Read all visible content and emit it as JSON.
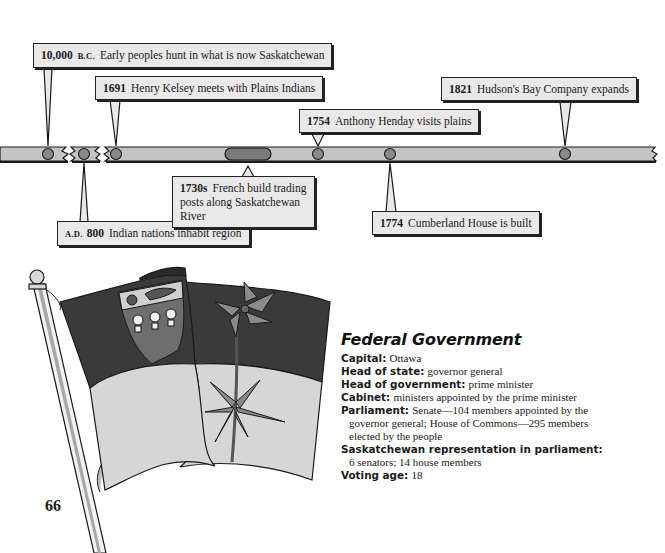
{
  "timeline": {
    "events": [
      {
        "year": "10,000",
        "era": "B.C.",
        "text": "Early peoples hunt in what is now Saskatchewan",
        "position": "above"
      },
      {
        "year": "1691",
        "era": "",
        "text": "Henry Kelsey meets with Plains Indians",
        "position": "above"
      },
      {
        "year": "1754",
        "era": "",
        "text": "Anthony Henday visits plains",
        "position": "above"
      },
      {
        "year": "1821",
        "era": "",
        "text": "Hudson's Bay Company expands",
        "position": "above"
      },
      {
        "year": "800",
        "era": "A.D.",
        "text": "Indian nations inhabit region",
        "position": "below"
      },
      {
        "year": "1730s",
        "era": "",
        "text": "French build trading posts along Saskatchewan River",
        "line1": "French build trading",
        "line2": "posts along Saskatchewan River",
        "position": "below"
      },
      {
        "year": "1774",
        "era": "",
        "text": "Cumberland House is built",
        "position": "below"
      }
    ],
    "colors": {
      "bar": "#c4c4c4",
      "marker": "#8a8a8a",
      "outline": "#1a1a1a",
      "callout_bg": "#e9e9e9"
    }
  },
  "flag": {
    "description": "Saskatchewan provincial flag on a pole",
    "colors": {
      "top_band": "#3a3a3a",
      "bottom_band": "#d6d6d6",
      "shield": "#6e6e6e",
      "flower": "#8a8a8a"
    }
  },
  "page": {
    "number": "66"
  },
  "federal_government": {
    "title": "Federal Government",
    "items": [
      {
        "label": "Capital:",
        "value": "Ottawa"
      },
      {
        "label": "Head of state:",
        "value": "governor general"
      },
      {
        "label": "Head of government:",
        "value": "prime minister"
      },
      {
        "label": "Cabinet:",
        "value": "ministers appointed by the prime minister"
      },
      {
        "label": "Parliament:",
        "value": "Senate—104 members appointed by the",
        "cont1": "governor general; House of Commons—295 members",
        "cont2": "elected by the people"
      },
      {
        "label": "Saskatchewan representation in parliament:",
        "value": "",
        "cont1": "6 senators; 14 house members"
      },
      {
        "label": "Voting age:",
        "value": "18"
      }
    ]
  }
}
